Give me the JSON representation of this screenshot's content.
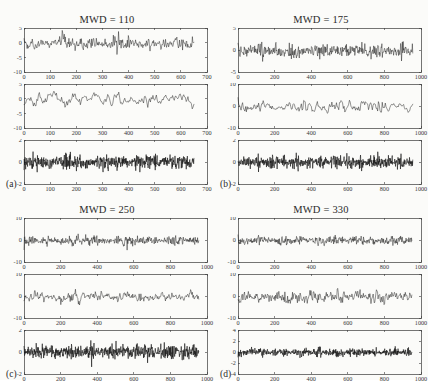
{
  "figure": {
    "background_color": "#fbfbf9",
    "trace_color": "#111111",
    "axis_color": "#3a3a3a",
    "width": 428,
    "height": 380
  },
  "panels": [
    {
      "id": "a",
      "label": "(a)",
      "title": "MWD = 110",
      "position": {
        "left": 0,
        "top": 0
      },
      "subplots": [
        {
          "name": "subplot-1",
          "ylim": [
            -10,
            5
          ],
          "yticks": [
            5,
            0,
            -5,
            -10
          ],
          "xlim": [
            0,
            700
          ],
          "xticks": [
            0,
            100,
            200,
            300,
            400,
            500,
            600,
            700
          ],
          "data_end_x": 650,
          "n_points": 330,
          "amplitude": 2.5,
          "mean": -0.4,
          "smoothness": 0.35,
          "seed": 11,
          "thick": false
        },
        {
          "name": "subplot-2",
          "ylim": [
            -10,
            5
          ],
          "yticks": [
            5,
            0,
            -5,
            -10
          ],
          "xlim": [
            0,
            700
          ],
          "xticks": [
            0,
            100,
            200,
            300,
            400,
            500,
            600,
            700
          ],
          "data_end_x": 650,
          "n_points": 200,
          "amplitude": 2.2,
          "mean": -0.2,
          "smoothness": 0.62,
          "seed": 23,
          "thick": false
        },
        {
          "name": "subplot-3",
          "ylim": [
            -2,
            2
          ],
          "yticks": [
            2,
            0,
            -2
          ],
          "xlim": [
            0,
            700
          ],
          "xticks": [
            0,
            100,
            200,
            300,
            400,
            500,
            600,
            700
          ],
          "data_end_x": 650,
          "n_points": 620,
          "amplitude": 0.62,
          "mean": 0,
          "smoothness": 0.05,
          "seed": 37,
          "thick": true
        }
      ]
    },
    {
      "id": "b",
      "label": "(b)",
      "title": "MWD = 175",
      "position": {
        "left": 214,
        "top": 0
      },
      "subplots": [
        {
          "name": "subplot-1",
          "ylim": [
            -5,
            5
          ],
          "yticks": [
            5,
            0,
            -5
          ],
          "xlim": [
            0,
            1000
          ],
          "xticks": [
            0,
            200,
            400,
            600,
            800,
            1000
          ],
          "data_end_x": 955,
          "n_points": 420,
          "amplitude": 1.5,
          "mean": -0.2,
          "smoothness": 0.12,
          "seed": 53,
          "thick": false
        },
        {
          "name": "subplot-2",
          "ylim": [
            -10,
            10
          ],
          "yticks": [
            10,
            0,
            -10
          ],
          "xlim": [
            0,
            1000
          ],
          "xticks": [
            0,
            200,
            400,
            600,
            800,
            1000
          ],
          "data_end_x": 955,
          "n_points": 230,
          "amplitude": 2.8,
          "mean": -0.3,
          "smoothness": 0.6,
          "seed": 67,
          "thick": false
        },
        {
          "name": "subplot-3",
          "ylim": [
            -2,
            2
          ],
          "yticks": [
            2,
            0,
            -2
          ],
          "xlim": [
            0,
            1000
          ],
          "xticks": [
            0,
            200,
            400,
            600,
            800,
            1000
          ],
          "data_end_x": 955,
          "n_points": 640,
          "amplitude": 0.6,
          "mean": 0,
          "smoothness": 0.05,
          "seed": 79,
          "thick": true
        }
      ]
    },
    {
      "id": "c",
      "label": "(c)",
      "title": "MWD = 250",
      "position": {
        "left": 0,
        "top": 190
      },
      "subplots": [
        {
          "name": "subplot-1",
          "ylim": [
            -10,
            10
          ],
          "yticks": [
            10,
            0,
            -10
          ],
          "xlim": [
            0,
            1000
          ],
          "xticks": [
            0,
            200,
            400,
            600,
            800,
            1000
          ],
          "data_end_x": 955,
          "n_points": 440,
          "amplitude": 2.3,
          "mean": -0.3,
          "smoothness": 0.15,
          "seed": 91,
          "thick": false
        },
        {
          "name": "subplot-2",
          "ylim": [
            -10,
            10
          ],
          "yticks": [
            10,
            0,
            -10
          ],
          "xlim": [
            0,
            1000
          ],
          "xticks": [
            0,
            200,
            400,
            600,
            800,
            1000
          ],
          "data_end_x": 955,
          "n_points": 300,
          "amplitude": 2.6,
          "mean": -0.2,
          "smoothness": 0.42,
          "seed": 103,
          "thick": false
        },
        {
          "name": "subplot-3",
          "ylim": [
            -2,
            2
          ],
          "yticks": [
            2,
            0,
            -2
          ],
          "xlim": [
            0,
            1000
          ],
          "xticks": [
            0,
            200,
            400,
            600,
            800,
            1000
          ],
          "data_end_x": 955,
          "n_points": 660,
          "amplitude": 0.68,
          "mean": 0,
          "smoothness": 0.04,
          "seed": 117,
          "thick": true
        }
      ]
    },
    {
      "id": "d",
      "label": "(d)",
      "title": "MWD = 330",
      "position": {
        "left": 214,
        "top": 190
      },
      "subplots": [
        {
          "name": "subplot-1",
          "ylim": [
            -10,
            10
          ],
          "yticks": [
            10,
            0,
            -10
          ],
          "xlim": [
            0,
            1000
          ],
          "xticks": [
            0,
            200,
            400,
            600,
            800,
            1000
          ],
          "data_end_x": 950,
          "n_points": 450,
          "amplitude": 1.9,
          "mean": -0.3,
          "smoothness": 0.15,
          "seed": 131,
          "thick": false
        },
        {
          "name": "subplot-2",
          "ylim": [
            -10,
            10
          ],
          "yticks": [
            10,
            0,
            -10
          ],
          "xlim": [
            0,
            1000
          ],
          "xticks": [
            0,
            200,
            400,
            600,
            800,
            1000
          ],
          "data_end_x": 950,
          "n_points": 320,
          "amplitude": 2.7,
          "mean": -0.2,
          "smoothness": 0.38,
          "seed": 149,
          "thick": false
        },
        {
          "name": "subplot-3",
          "ylim": [
            -4,
            4
          ],
          "yticks": [
            4,
            2,
            0,
            -2,
            -4
          ],
          "xlim": [
            0,
            1000
          ],
          "xticks": [
            0,
            200,
            400,
            600,
            800,
            1000
          ],
          "data_end_x": 950,
          "n_points": 680,
          "amplitude": 0.72,
          "mean": -0.05,
          "smoothness": 0.04,
          "seed": 163,
          "thick": true
        }
      ]
    }
  ],
  "chart_data": {
    "type": "line",
    "panel_titles": [
      "MWD = 110",
      "MWD = 175",
      "MWD = 250",
      "MWD = 330"
    ],
    "panel_labels": [
      "(a)",
      "(b)",
      "(c)",
      "(d)"
    ],
    "xlabel": "",
    "ylabel": "",
    "grid": false,
    "legend": "none",
    "panels": [
      {
        "label": "(a)",
        "title": "MWD = 110",
        "xlim": [
          0,
          700
        ],
        "xticks": [
          0,
          100,
          200,
          300,
          400,
          500,
          600,
          700
        ],
        "series": [
          {
            "name": "a-top",
            "ylim": [
              -10,
              5
            ],
            "yticks": [
              5,
              0,
              -5,
              -10
            ],
            "approx_range": [
              -6.5,
              4.5
            ]
          },
          {
            "name": "a-middle",
            "ylim": [
              -10,
              5
            ],
            "yticks": [
              5,
              0,
              -5,
              -10
            ],
            "approx_range": [
              -6,
              3.5
            ]
          },
          {
            "name": "a-bottom",
            "ylim": [
              -2,
              2
            ],
            "yticks": [
              2,
              0,
              -2
            ],
            "approx_range": [
              -1.8,
              1.5
            ]
          }
        ]
      },
      {
        "label": "(b)",
        "title": "MWD = 175",
        "xlim": [
          0,
          1000
        ],
        "xticks": [
          0,
          200,
          400,
          600,
          800,
          1000
        ],
        "series": [
          {
            "name": "b-top",
            "ylim": [
              -5,
              5
            ],
            "yticks": [
              5,
              0,
              -5
            ],
            "approx_range": [
              -4,
              4.5
            ]
          },
          {
            "name": "b-middle",
            "ylim": [
              -10,
              10
            ],
            "yticks": [
              10,
              0,
              -10
            ],
            "approx_range": [
              -8,
              6
            ]
          },
          {
            "name": "b-bottom",
            "ylim": [
              -2,
              2
            ],
            "yticks": [
              2,
              0,
              -2
            ],
            "approx_range": [
              -1.8,
              1.6
            ]
          }
        ]
      },
      {
        "label": "(c)",
        "title": "MWD = 250",
        "xlim": [
          0,
          1000
        ],
        "xticks": [
          0,
          200,
          400,
          600,
          800,
          1000
        ],
        "series": [
          {
            "name": "c-top",
            "ylim": [
              -10,
              10
            ],
            "yticks": [
              10,
              0,
              -10
            ],
            "approx_range": [
              -7,
              6
            ]
          },
          {
            "name": "c-middle",
            "ylim": [
              -10,
              10
            ],
            "yticks": [
              10,
              0,
              -10
            ],
            "approx_range": [
              -8,
              7
            ]
          },
          {
            "name": "c-bottom",
            "ylim": [
              -2,
              2
            ],
            "yticks": [
              2,
              0,
              -2
            ],
            "approx_range": [
              -1.9,
              1.7
            ]
          }
        ]
      },
      {
        "label": "(d)",
        "title": "MWD = 330",
        "xlim": [
          0,
          1000
        ],
        "xticks": [
          0,
          200,
          400,
          600,
          800,
          1000
        ],
        "series": [
          {
            "name": "d-top",
            "ylim": [
              -10,
              10
            ],
            "yticks": [
              10,
              0,
              -10
            ],
            "approx_range": [
              -6.5,
              5
            ]
          },
          {
            "name": "d-middle",
            "ylim": [
              -10,
              10
            ],
            "yticks": [
              10,
              0,
              -10
            ],
            "approx_range": [
              -8,
              7
            ]
          },
          {
            "name": "d-bottom",
            "ylim": [
              -4,
              4
            ],
            "yticks": [
              4,
              2,
              0,
              -2,
              -4
            ],
            "approx_range": [
              -2,
              2.2
            ]
          }
        ]
      }
    ]
  }
}
